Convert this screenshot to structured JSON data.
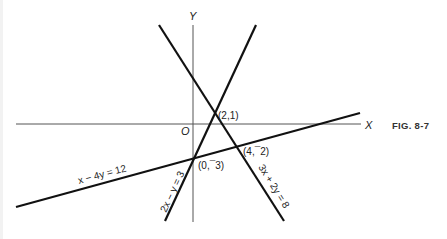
{
  "figure": {
    "caption": "FIG. 8-7",
    "axes": {
      "x_label": "X",
      "y_label": "Y",
      "origin_label": "O"
    },
    "lines": [
      {
        "id": "line-3x-2y-8",
        "equation": "3x + 2y = 8"
      },
      {
        "id": "line-2x-y-3",
        "equation": "2x − y = 3"
      },
      {
        "id": "line-x-4y-12",
        "equation": "x − 4y = 12"
      }
    ],
    "points": [
      {
        "id": "pt-2-1",
        "label": "(2,1)"
      },
      {
        "id": "pt-4-neg2",
        "label": "(4,¯2)"
      },
      {
        "id": "pt-0-neg3",
        "label": "(0,¯3)"
      }
    ],
    "colors": {
      "line": "#111111",
      "axis": "#555555",
      "background": "#ffffff"
    }
  }
}
